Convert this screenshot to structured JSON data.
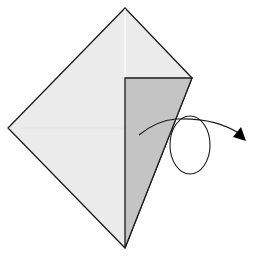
{
  "diagram": {
    "type": "origami-step",
    "description": "Kite-shaped paper with a right-side flap folded; arrow with loop indicates turning the model over",
    "colors": {
      "paper": "#ebebeb",
      "flap": "#c4c4c4",
      "line": "#1a1a1a",
      "crease": "#ffffff",
      "background": "#ffffff"
    },
    "shapes": {
      "kite": {
        "top": [
          125,
          8
        ],
        "right": [
          192,
          78
        ],
        "bottom": [
          125,
          248
        ],
        "left": [
          8,
          128
        ]
      },
      "flap": {
        "top_left": [
          125,
          78
        ],
        "top_right": [
          192,
          78
        ],
        "bottom": [
          125,
          248
        ]
      },
      "center_crease": {
        "from": [
          125,
          8
        ],
        "to": [
          125,
          78
        ]
      },
      "turn_over_arrow": {
        "start": [
          139,
          135
        ],
        "loop_center": [
          190,
          145
        ],
        "loop_rx": 20,
        "loop_ry": 30,
        "tip": [
          246,
          141
        ]
      }
    },
    "symbols": [
      "turn-over-arrow"
    ]
  }
}
